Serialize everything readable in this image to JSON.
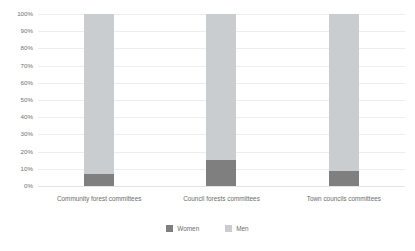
{
  "chart_data": {
    "type": "bar",
    "subtype": "stacked-100-percent",
    "title": "",
    "subtitle": "",
    "xlabel": "",
    "ylabel": "",
    "ylim": [
      0,
      100
    ],
    "grid": true,
    "legend_position": "bottom-center",
    "value_unit": "%",
    "categories": [
      "Community forest committees",
      "Council forests committees",
      "Town councils committees"
    ],
    "y_ticks": [
      "0%",
      "10%",
      "20%",
      "30%",
      "40%",
      "50%",
      "60%",
      "70%",
      "80%",
      "90%",
      "100%"
    ],
    "y_tick_values": [
      0,
      10,
      20,
      30,
      40,
      50,
      60,
      70,
      80,
      90,
      100
    ],
    "series": [
      {
        "name": "Women",
        "color": "#7f7f7f",
        "values": [
          7,
          15,
          9
        ]
      },
      {
        "name": "Men",
        "color": "#c9cdd0",
        "values": [
          93,
          85,
          91
        ]
      }
    ]
  },
  "legend": {
    "items": [
      {
        "label": "Women",
        "color": "#7f7f7f"
      },
      {
        "label": "Men",
        "color": "#c9cdd0"
      }
    ]
  },
  "colors": {
    "women": "#7f7f7f",
    "men": "#c9cdd0",
    "gridline": "#eceded",
    "text": "#6d6d6d",
    "background": "#ffffff"
  }
}
